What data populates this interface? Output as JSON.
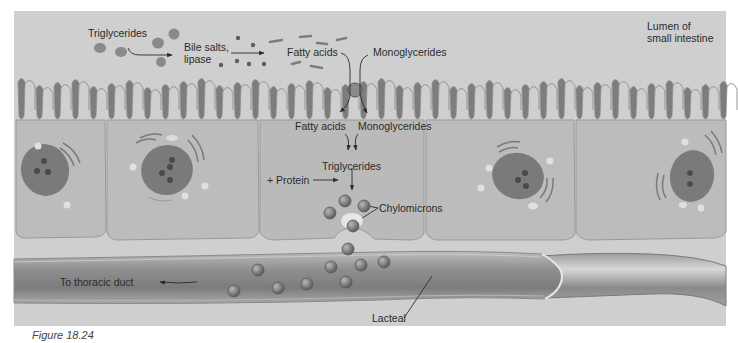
{
  "figure": {
    "caption": "Figure 18.24",
    "colors": {
      "lumen_bg": "#cfcfcf",
      "cell_fill": "#b9b9b9",
      "microvilli": "#7d7d7d",
      "nucleus": "#7a7a7a",
      "lacteal": "#9a9a9a",
      "chylomicron": "#8a8a8a",
      "text": "#2b2b2b"
    }
  },
  "labels": {
    "lumen": [
      "Lumen of",
      "small intestine"
    ],
    "triglycerides_top": "Triglycerides",
    "bile_salts": [
      "Bile salts,",
      "lipase"
    ],
    "fatty_acids_top": "Fatty acids",
    "monoglycerides_top": "Monoglycerides",
    "fatty_acids_cell": "Fatty acids",
    "monoglycerides_cell": "Monoglycerides",
    "triglycerides_cell": "Triglycerides",
    "protein": "+ Protein",
    "chylomicrons": "Chylomicrons",
    "thoracic_duct": "To thoracic duct",
    "lacteal": "Lacteal"
  }
}
